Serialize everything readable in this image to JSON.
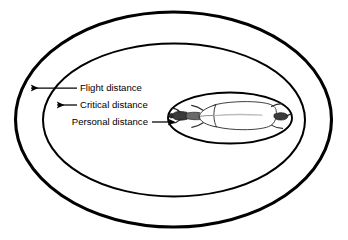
{
  "figure": {
    "background_color": "#ffffff",
    "stroke_color": "#000000",
    "subject": {
      "name": "cow-top-view",
      "description": "Top-down silhouette of a cow inside the innermost zone",
      "fill_color": "#ffffff",
      "shade_color": "#5a5a5a"
    },
    "zones": [
      {
        "id": "flight",
        "label": "Flight distance",
        "ring": "outer-ellipse",
        "stroke_width": 3.1
      },
      {
        "id": "critical",
        "label": "Critical distance",
        "ring": "middle-ellipse",
        "stroke_width": 2.0
      },
      {
        "id": "personal",
        "label": "Personal distance",
        "ring": "inner-ellipse",
        "stroke_width": 2.0
      }
    ],
    "labels": {
      "flight": {
        "text": "Flight distance",
        "text_x": 78,
        "text_y": 88,
        "anchor": "start",
        "arrow_direction": "left",
        "arrow_from_x": 77,
        "arrow_to_x": 29,
        "arrow_y": 88
      },
      "critical": {
        "text": "Critical distance",
        "text_x": 78,
        "text_y": 105,
        "anchor": "start",
        "arrow_direction": "left",
        "arrow_from_x": 77,
        "arrow_to_x": 55,
        "arrow_y": 105
      },
      "personal": {
        "text": "Personal distance",
        "text_x": 148,
        "text_y": 122,
        "anchor": "end",
        "arrow_direction": "right",
        "arrow_from_x": 152,
        "arrow_to_x": 170,
        "arrow_y": 122
      }
    }
  }
}
